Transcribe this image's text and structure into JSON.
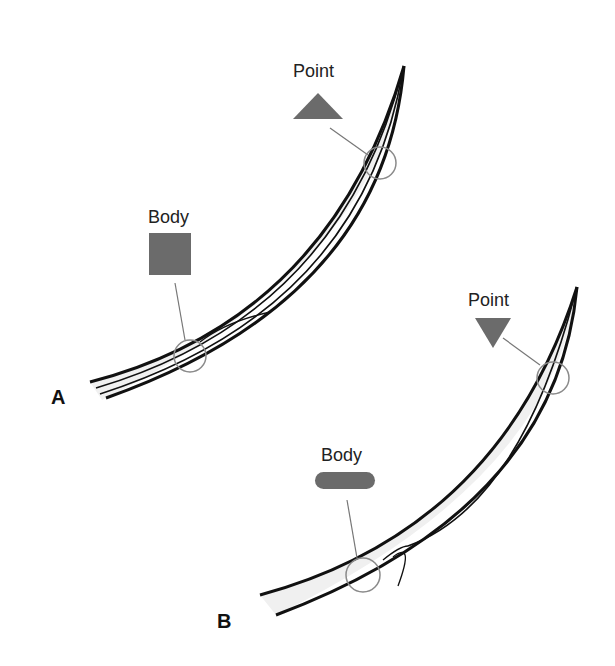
{
  "diagram": {
    "panels": [
      {
        "id": "A",
        "letter": "A",
        "needle": "taper-point needle",
        "point_label": "Point",
        "point_shape": "triangle-up",
        "body_label": "Body",
        "body_shape": "square"
      },
      {
        "id": "B",
        "letter": "B",
        "needle": "reverse-cutting needle",
        "point_label": "Point",
        "point_shape": "triangle-down",
        "body_label": "Body",
        "body_shape": "rounded-bar"
      }
    ],
    "colors": {
      "shape_fill": "#6b6b6b",
      "outline": "#111111",
      "needle_fill": "#f0f0f0",
      "leader_line": "#777777",
      "callout_circle": "#8a8a8a"
    }
  }
}
